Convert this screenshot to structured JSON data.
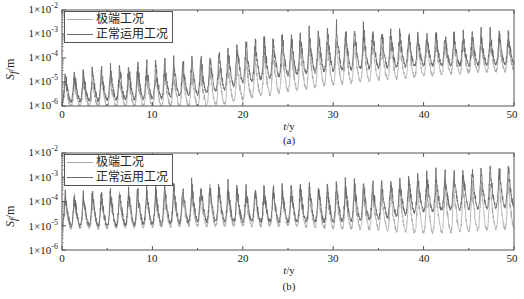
{
  "figure": {
    "panels": [
      {
        "id": "a",
        "caption": "(a)",
        "ylabel_main": "S",
        "ylabel_sub": "f",
        "ylabel_unit": "/m",
        "xlabel_main": "t",
        "xlabel_unit": "/y",
        "yticks": [
          {
            "base": "1×10",
            "exp": "-2"
          },
          {
            "base": "1×10",
            "exp": "-3"
          },
          {
            "base": "1×10",
            "exp": "-4"
          },
          {
            "base": "1×10",
            "exp": "-5"
          },
          {
            "base": "1×10",
            "exp": "-6"
          }
        ],
        "xticks": [
          "0",
          "10",
          "20",
          "30",
          "40",
          "50"
        ],
        "legend": [
          "极端工况",
          "正常运用工况"
        ]
      },
      {
        "id": "b",
        "caption": "(b)",
        "ylabel_main": "S",
        "ylabel_sub": "f",
        "ylabel_unit": "/m",
        "xlabel_main": "t",
        "xlabel_unit": "/y",
        "yticks": [
          {
            "base": "1×10",
            "exp": "-2"
          },
          {
            "base": "1×10",
            "exp": "-3"
          },
          {
            "base": "1×10",
            "exp": "-4"
          },
          {
            "base": "1×10",
            "exp": "-5"
          },
          {
            "base": "1×10",
            "exp": "-6"
          }
        ],
        "xticks": [
          "0",
          "10",
          "20",
          "30",
          "40",
          "50"
        ],
        "legend": [
          "极端工况",
          "正常运用工况"
        ]
      }
    ],
    "colors": {
      "extreme": "#a8a8a8",
      "normal": "#6a6a6a",
      "frame": "#555555"
    }
  },
  "chart_data": [
    {
      "type": "line",
      "title": "(a)",
      "xlabel": "t/y",
      "ylabel": "S_f/m",
      "xlim": [
        0,
        50
      ],
      "ylim": [
        1e-06,
        0.01
      ],
      "yscale": "log",
      "legend_position": "upper left",
      "grid": false,
      "series": [
        {
          "name": "极端工况",
          "description": "Periodic yearly peaks; baseline ~1e-6 before t≈18, rising to ~1e-5 by t≈30 and ~3e-5 by t≈50; peaks ~2e-5 early rising to ~1e-3 after t≈25",
          "x": [
            0,
            5,
            10,
            15,
            18,
            20,
            25,
            30,
            35,
            40,
            45,
            50
          ],
          "baseline": [
            1e-06,
            1e-06,
            1e-06,
            1e-06,
            1.2e-06,
            2e-06,
            4e-06,
            8e-06,
            1.2e-05,
            1.8e-05,
            2.5e-05,
            3e-05
          ],
          "peak": [
            1.5e-05,
            2e-05,
            3e-05,
            5e-05,
            8e-05,
            0.00015,
            0.0005,
            0.001,
            0.001,
            0.0008,
            0.0007,
            0.0008
          ]
        },
        {
          "name": "正常运用工况",
          "description": "Periodic yearly peaks; baseline ~1.5e-6 early rising to ~5e-5 by t≈40; peaks ~3e-5 at t=0 rising to ~3e-3 around t≈30-35",
          "x": [
            0,
            5,
            10,
            15,
            18,
            20,
            25,
            30,
            35,
            40,
            45,
            50
          ],
          "baseline": [
            1.5e-06,
            1.8e-06,
            2e-06,
            3e-06,
            5e-06,
            1e-05,
            2e-05,
            3e-05,
            4e-05,
            5e-05,
            5e-05,
            6e-05
          ],
          "peak": [
            3e-05,
            5e-05,
            8e-05,
            0.00015,
            0.0003,
            0.0008,
            0.0015,
            0.003,
            0.0025,
            0.0015,
            0.0015,
            0.0015
          ]
        }
      ]
    },
    {
      "type": "line",
      "title": "(b)",
      "xlabel": "t/y",
      "ylabel": "S_f/m",
      "xlim": [
        0,
        50
      ],
      "ylim": [
        1e-06,
        0.01
      ],
      "yscale": "log",
      "legend_position": "upper left",
      "grid": false,
      "series": [
        {
          "name": "极端工况",
          "description": "Overlaps normal curve until t≈35, then lower baseline ~5e-6 to 1e-5 with peaks ~1e-3",
          "x": [
            0,
            5,
            10,
            15,
            20,
            25,
            30,
            35,
            40,
            45,
            50
          ],
          "baseline": [
            8e-06,
            8e-06,
            9e-06,
            1e-05,
            1e-05,
            1e-05,
            8e-06,
            7e-06,
            5e-06,
            6e-06,
            8e-06
          ],
          "peak": [
            0.0002,
            0.0003,
            0.0003,
            0.0004,
            0.0003,
            0.0004,
            0.0005,
            0.0005,
            0.0008,
            0.001,
            0.0015
          ]
        },
        {
          "name": "正常运用工况",
          "description": "Baseline ~1e-5 throughout with deep dips to 1e-6 near t≈1,2,8,16; peaks ~3e-4 rising to ~5e-3 near t≈50",
          "x": [
            0,
            5,
            10,
            15,
            20,
            25,
            30,
            35,
            40,
            45,
            50
          ],
          "baseline": [
            1e-05,
            1e-05,
            1.2e-05,
            1.5e-05,
            1.5e-05,
            1.5e-05,
            1.5e-05,
            2e-05,
            4e-05,
            5e-05,
            6e-05
          ],
          "peak": [
            0.0003,
            0.0004,
            0.0005,
            0.0012,
            0.0005,
            0.0006,
            0.0008,
            0.001,
            0.002,
            0.003,
            0.005
          ]
        }
      ]
    }
  ]
}
